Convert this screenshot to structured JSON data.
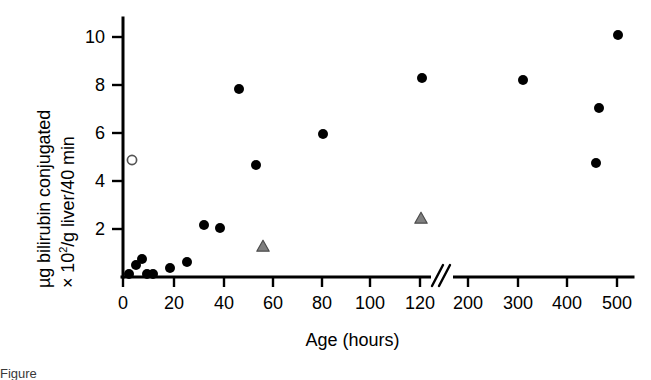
{
  "figure": {
    "title": "",
    "xlabel": "Age (hours)",
    "ylabel_line1": "µg bilirubin conjugated",
    "ylabel_line2_prefix": "× 10",
    "ylabel_line2_exp": "2",
    "ylabel_line2_suffix": "/g liver/40 min",
    "caption_partial": "Figure"
  },
  "axis": {
    "x_ticks": [
      "0",
      "20",
      "40",
      "60",
      "80",
      "100",
      "120",
      "200",
      "300",
      "400",
      "500"
    ],
    "y_ticks": [
      "2",
      "4",
      "6",
      "8",
      "10"
    ],
    "break_symbol": "//",
    "has_axis_break": true,
    "break_after": "120"
  },
  "colors": {
    "axis": "#000000",
    "filled_circle": "#000000",
    "open_circle_stroke": "#555555",
    "triangle_fill": "#808080",
    "triangle_stroke": "#4d4d4d",
    "background": "#ffffff"
  },
  "chart_data": {
    "type": "scatter",
    "title": "",
    "xlabel": "Age (hours)",
    "ylabel": "µg bilirubin conjugated × 10²/g liver/40 min",
    "xlim": [
      0,
      500
    ],
    "ylim": [
      0,
      10.6
    ],
    "xscale": "broken-linear",
    "x_axis_break": {
      "after": 120,
      "resumes_at": 200
    },
    "grid": false,
    "legend": "none",
    "series": [
      {
        "name": "filled-circle",
        "marker": "filled-circle",
        "color": "#000000",
        "points": [
          {
            "x": 3,
            "y": 0.1
          },
          {
            "x": 6,
            "y": 0.55
          },
          {
            "x": 8,
            "y": 0.9
          },
          {
            "x": 9,
            "y": 0.1
          },
          {
            "x": 11,
            "y": 0.1
          },
          {
            "x": 19,
            "y": 0.45
          },
          {
            "x": 26,
            "y": 0.65
          },
          {
            "x": 33,
            "y": 2.2
          },
          {
            "x": 39,
            "y": 2.1
          },
          {
            "x": 46,
            "y": 7.85
          },
          {
            "x": 53,
            "y": 4.7
          },
          {
            "x": 80,
            "y": 5.95
          },
          {
            "x": 120,
            "y": 8.3
          },
          {
            "x": 300,
            "y": 8.2
          },
          {
            "x": 455,
            "y": 4.8
          },
          {
            "x": 460,
            "y": 7.1
          },
          {
            "x": 500,
            "y": 10.1
          }
        ]
      },
      {
        "name": "open-circle",
        "marker": "open-circle",
        "color": "#555555",
        "points": [
          {
            "x": 4,
            "y": 4.75
          }
        ]
      },
      {
        "name": "gray-triangle",
        "marker": "filled-triangle",
        "color": "#808080",
        "points": [
          {
            "x": 57,
            "y": 1.3
          },
          {
            "x": 120,
            "y": 2.4
          }
        ]
      }
    ]
  },
  "geometry": {
    "plot": {
      "left": 123,
      "right": 633,
      "top": 18,
      "bottom": 277
    },
    "x_tick_px": [
      123,
      174,
      224,
      273,
      322,
      370,
      420,
      468,
      518,
      567,
      617
    ],
    "y_tick_px": {
      "2": 229,
      "4": 181,
      "6": 133,
      "8": 85,
      "10": 37
    },
    "break_px": 442,
    "markers": {
      "filled_circle_r": 5.0,
      "open_circle_r": 4.6,
      "triangle_half_w": 6.2,
      "triangle_h": 11.0
    },
    "point_px": {
      "filled": [
        [
          129,
          274
        ],
        [
          136,
          265
        ],
        [
          142,
          259
        ],
        [
          147,
          274
        ],
        [
          153,
          274
        ],
        [
          170,
          268
        ],
        [
          187,
          262
        ],
        [
          204,
          225
        ],
        [
          220,
          228
        ],
        [
          239,
          89
        ],
        [
          256,
          165
        ],
        [
          323,
          134
        ],
        [
          422,
          78
        ],
        [
          523,
          80
        ],
        [
          596,
          163
        ],
        [
          599,
          108
        ],
        [
          618,
          35
        ]
      ],
      "open": [
        [
          132,
          160
        ]
      ],
      "triangle": [
        [
          263,
          247
        ],
        [
          421,
          219
        ]
      ]
    }
  }
}
